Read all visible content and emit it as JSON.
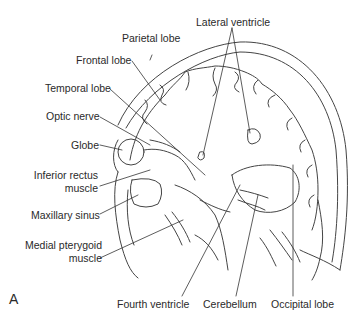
{
  "figure": {
    "panel_label": "A",
    "labels": {
      "parietal_lobe": "Parietal lobe",
      "lateral_ventricle": "Lateral ventricle",
      "frontal_lobe": "Frontal lobe",
      "temporal_lobe": "Temporal lobe",
      "optic_nerve": "Optic nerve",
      "globe": "Globe",
      "inferior_rectus_line1": "Inferior rectus",
      "inferior_rectus_line2": "muscle",
      "maxillary_sinus": "Maxillary sinus",
      "medial_pterygoid_line1": "Medial pterygoid",
      "medial_pterygoid_line2": "muscle",
      "fourth_ventricle": "Fourth ventricle",
      "cerebellum": "Cerebellum",
      "occipital_lobe": "Occipital lobe"
    },
    "colors": {
      "line": "#444444",
      "text": "#2a2a2a",
      "background": "#ffffff"
    }
  }
}
